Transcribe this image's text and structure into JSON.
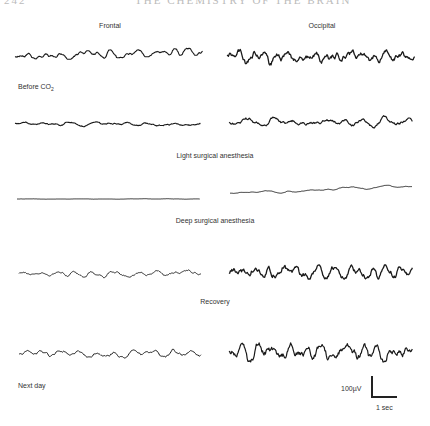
{
  "header": {
    "page_number": "242",
    "running_head": "THE CHEMISTRY OF THE BRAIN"
  },
  "columns": [
    {
      "label": "Frontal",
      "x": 110,
      "y": 22
    },
    {
      "label": "Occipital",
      "x": 322,
      "y": 22
    }
  ],
  "conditions": [
    {
      "label": "Before CO",
      "subscript": "2",
      "x": 18,
      "y": 83,
      "align": "left"
    },
    {
      "label": "Light surgical anesthesia",
      "x": 215,
      "y": 152,
      "align": "center"
    },
    {
      "label": "Deep surgical anesthesia",
      "x": 215,
      "y": 217,
      "align": "center"
    },
    {
      "label": "Recovery",
      "x": 215,
      "y": 298,
      "align": "center"
    },
    {
      "label": "Next day",
      "x": 18,
      "y": 382,
      "align": "left"
    }
  ],
  "traces": [
    {
      "row": 1,
      "channel": "frontal",
      "x0": 15,
      "x1": 203,
      "y": 57,
      "amp": 4,
      "freq": 0.55,
      "drift": -6,
      "seed": 11,
      "width": 1.1
    },
    {
      "row": 1,
      "channel": "occipital",
      "x0": 227,
      "x1": 415,
      "y": 57,
      "amp": 8,
      "freq": 0.8,
      "drift": 0,
      "seed": 23,
      "width": 1.3
    },
    {
      "row": 2,
      "channel": "frontal",
      "x0": 15,
      "x1": 201,
      "y": 124,
      "amp": 8,
      "freq": 0.18,
      "drift": 0,
      "seed": 37,
      "width": 1.1
    },
    {
      "row": 2,
      "channel": "occipital",
      "x0": 229,
      "x1": 413,
      "y": 122,
      "amp": 11,
      "freq": 0.3,
      "drift": 0,
      "seed": 41,
      "width": 1.2
    },
    {
      "row": 3,
      "channel": "frontal",
      "x0": 17,
      "x1": 200,
      "y": 199,
      "amp": 2,
      "freq": 0.02,
      "drift": 0,
      "seed": 53,
      "width": 0.9
    },
    {
      "row": 3,
      "channel": "occipital",
      "x0": 230,
      "x1": 412,
      "y": 193,
      "amp": 3,
      "freq": 0.12,
      "drift": -7,
      "seed": 61,
      "width": 0.9
    },
    {
      "row": 4,
      "channel": "frontal",
      "x0": 19,
      "x1": 201,
      "y": 274,
      "amp": 5,
      "freq": 0.35,
      "drift": 0,
      "seed": 71,
      "width": 0.9
    },
    {
      "row": 4,
      "channel": "occipital",
      "x0": 229,
      "x1": 413,
      "y": 272,
      "amp": 7,
      "freq": 0.9,
      "drift": 0,
      "seed": 83,
      "width": 1.3
    },
    {
      "row": 5,
      "channel": "frontal",
      "x0": 19,
      "x1": 201,
      "y": 354,
      "amp": 5,
      "freq": 0.45,
      "drift": 0,
      "seed": 97,
      "width": 1.0
    },
    {
      "row": 5,
      "channel": "occipital",
      "x0": 229,
      "x1": 413,
      "y": 352,
      "amp": 10,
      "freq": 0.85,
      "drift": 0,
      "seed": 101,
      "width": 1.2
    }
  ],
  "scale_bar": {
    "voltage_label": "100µV",
    "time_label": "1 sec"
  },
  "colors": {
    "trace": "#1a1a1a"
  }
}
